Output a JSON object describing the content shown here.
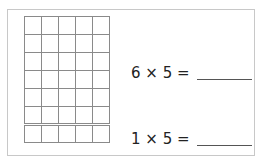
{
  "worksheet": {
    "grid": {
      "rows": 7,
      "columns": 5,
      "separator_after_row": 6
    },
    "equations": [
      {
        "text": "6 × 5 =",
        "answer": ""
      },
      {
        "text": "1 × 5 =",
        "answer": ""
      }
    ]
  },
  "colors": {
    "grid_line": "#8a8a8a",
    "border": "#c8c8c8",
    "text": "#222222"
  }
}
